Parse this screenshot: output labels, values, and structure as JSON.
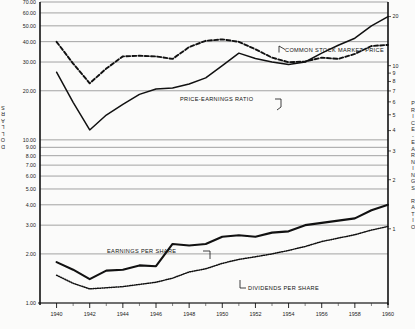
{
  "chart_data": {
    "type": "line",
    "title": "",
    "xlabel": "",
    "ylabel": "DOLLARS",
    "ylabel_right": "PRICE-EARNINGS RATIO",
    "x_scale": "linear",
    "y_scale": "log",
    "xlim": [
      1939,
      1960
    ],
    "ylim": [
      1.0,
      70.0
    ],
    "ylim_right": [
      1,
      20
    ],
    "grid": true,
    "legend": "inline-annotations",
    "x_ticks": [
      1940,
      1942,
      1944,
      1946,
      1948,
      1950,
      1952,
      1954,
      1956,
      1958,
      1960
    ],
    "x_tick_labels": [
      "1940",
      "1942",
      "1944",
      "1946",
      "1948",
      "1950",
      "1952",
      "1954",
      "1956",
      "1958",
      "1960"
    ],
    "x_minor_ticks": [
      1941,
      1943,
      1945,
      1947,
      1949,
      1951,
      1953,
      1955,
      1957,
      1959
    ],
    "y_ticks_left": [
      70.0,
      60.0,
      50.0,
      40.0,
      30.0,
      20.0,
      10.0,
      9.0,
      8.0,
      7.0,
      6.0,
      5.0,
      4.0,
      3.0,
      2.0,
      1.0
    ],
    "y_tick_labels_left": [
      "70.00",
      "60.00",
      "50.00",
      "40.00",
      "30.00",
      "20.00",
      "10.00",
      "9.00",
      "8.00",
      "7.00",
      "6.00",
      "5.00",
      "4.00",
      "3.00",
      "2.00",
      "1.00"
    ],
    "y_ticks_right": [
      20,
      10,
      9,
      8,
      7,
      6,
      5,
      4,
      3,
      2,
      1
    ],
    "y_tick_labels_right": [
      "20",
      "10",
      "9",
      "8",
      "7",
      "6",
      "5",
      "4",
      "3",
      "2",
      "1"
    ],
    "annotations": [
      {
        "text": "COMMON STOCK MARKET PRICE",
        "series": "common_stock_market_price"
      },
      {
        "text": "PRICE-EARNINGS RATIO",
        "series": "price_earnings_ratio"
      },
      {
        "text": "EARNINGS PER SHARE",
        "series": "earnings_per_share"
      },
      {
        "text": "DIVIDENDS PER SHARE",
        "series": "dividends_per_share"
      }
    ],
    "x": [
      1940,
      1941,
      1942,
      1943,
      1944,
      1945,
      1946,
      1947,
      1948,
      1949,
      1950,
      1951,
      1952,
      1953,
      1954,
      1955,
      1956,
      1957,
      1958,
      1959,
      1960
    ],
    "series": [
      {
        "name": "COMMON STOCK MARKET PRICE",
        "key": "common_stock_market_price",
        "axis": "left",
        "style": "solid",
        "values": [
          26.0,
          17.0,
          11.5,
          14.2,
          16.5,
          19.0,
          20.5,
          20.8,
          22.0,
          24.0,
          28.5,
          34.0,
          31.5,
          30.0,
          29.0,
          30.0,
          34.0,
          38.0,
          42.0,
          50.0,
          57.0
        ]
      },
      {
        "name": "PRICE-EARNINGS RATIO",
        "key": "price_earnings_ratio",
        "axis": "right",
        "style": "dashed",
        "values": [
          14.0,
          10.3,
          7.8,
          9.6,
          11.4,
          11.5,
          11.4,
          11.0,
          13.0,
          14.2,
          14.5,
          14.0,
          12.6,
          11.2,
          10.5,
          10.6,
          11.2,
          11.0,
          11.8,
          13.2,
          13.4
        ]
      },
      {
        "name": "EARNINGS PER SHARE",
        "key": "earnings_per_share",
        "axis": "left",
        "style": "thick-solid",
        "values": [
          1.78,
          1.6,
          1.4,
          1.58,
          1.6,
          1.7,
          1.68,
          2.3,
          2.25,
          2.3,
          2.55,
          2.6,
          2.55,
          2.7,
          2.75,
          3.0,
          3.1,
          3.2,
          3.3,
          3.7,
          4.0
        ]
      },
      {
        "name": "DIVIDENDS PER SHARE",
        "key": "dividends_per_share",
        "axis": "left",
        "style": "dotted",
        "values": [
          1.48,
          1.32,
          1.22,
          1.24,
          1.26,
          1.3,
          1.34,
          1.42,
          1.55,
          1.62,
          1.75,
          1.85,
          1.92,
          2.0,
          2.1,
          2.22,
          2.38,
          2.5,
          2.62,
          2.8,
          2.95
        ]
      }
    ]
  },
  "labels": {
    "axis_left_unit": "DOLLARS",
    "axis_right_unit": "PRICE-EARNINGS RATIO"
  }
}
